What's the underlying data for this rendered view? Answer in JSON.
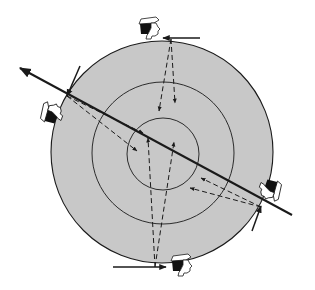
{
  "diagram": {
    "description": "Concentric circles viewed by four observers around the rim, each looking inward along dashed sight lines; a solid line with arrowhead crosses the disk diagonally",
    "colors": {
      "background": "#ffffff",
      "disk_fill": "#c8c8c8",
      "stroke": "#1a1a1a",
      "skin": "#ffffff",
      "hair": "#111111"
    },
    "circles": [
      {
        "name": "outer",
        "cx": 162,
        "cy": 152,
        "r": 111
      },
      {
        "name": "middle",
        "cx": 163,
        "cy": 153,
        "r": 71
      },
      {
        "name": "inner",
        "cx": 163,
        "cy": 154,
        "r": 36
      }
    ],
    "main_line": {
      "from": [
        292,
        215
      ],
      "to": [
        20,
        68
      ],
      "arrowhead": "to"
    },
    "observers": [
      {
        "name": "top",
        "position": [
          150,
          28
        ],
        "rotation": 0,
        "tangent_arrow": {
          "from": [
            200,
            38
          ],
          "to": [
            163,
            38
          ]
        },
        "sight_lines": [
          {
            "from": [
              171,
              39
            ],
            "to": [
              159,
              111
            ]
          },
          {
            "from": [
              171,
              39
            ],
            "to": [
              175,
              103
            ]
          }
        ]
      },
      {
        "name": "left",
        "position": [
          52,
          113
        ],
        "rotation": -70,
        "tangent_arrow": {
          "from": [
            80,
            66
          ],
          "to": [
            67,
            96
          ]
        },
        "sight_lines": [
          {
            "from": [
              67,
              96
            ],
            "to": [
              143,
              133
            ]
          },
          {
            "from": [
              67,
              96
            ],
            "to": [
              137,
              151
            ]
          }
        ]
      },
      {
        "name": "right",
        "position": [
          270,
          190
        ],
        "rotation": 110,
        "tangent_arrow": {
          "from": [
            252,
            231
          ],
          "to": [
            261,
            206
          ]
        },
        "sight_lines": [
          {
            "from": [
              261,
              207
            ],
            "to": [
              201,
              178
            ]
          },
          {
            "from": [
              261,
              207
            ],
            "to": [
              190,
              188
            ]
          }
        ]
      },
      {
        "name": "bottom",
        "position": [
          182,
          265
        ],
        "rotation": 0,
        "tangent_arrow": {
          "from": [
            113,
            267
          ],
          "to": [
            166,
            267
          ]
        },
        "sight_lines": [
          {
            "from": [
              155,
              267
            ],
            "to": [
              148,
              138
            ]
          },
          {
            "from": [
              155,
              267
            ],
            "to": [
              174,
              142
            ]
          }
        ]
      }
    ]
  }
}
